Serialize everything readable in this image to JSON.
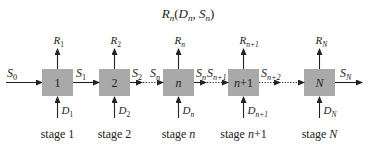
{
  "title": {
    "main": "R",
    "sub": "n",
    "args": [
      {
        "main": "D",
        "sub": "n"
      },
      {
        "main": "S",
        "sub": "n"
      }
    ]
  },
  "input_state": {
    "main": "S",
    "sub": "0"
  },
  "stages": [
    {
      "box_label": "1",
      "box_italic": false,
      "return": {
        "main": "R",
        "sub": "1"
      },
      "decision": {
        "main": "D",
        "sub": "1"
      },
      "out_state": {
        "main": "S",
        "sub": "1"
      },
      "caption": "stage",
      "caption_num": "1",
      "caption_italic": false
    },
    {
      "box_label": "2",
      "box_italic": false,
      "return": {
        "main": "R",
        "sub": "2"
      },
      "decision": {
        "main": "D",
        "sub": "2"
      },
      "out_state": {
        "main": "S",
        "sub": "2"
      },
      "caption": "stage",
      "caption_num": "2",
      "caption_italic": false
    },
    {
      "box_label": "n",
      "box_italic": true,
      "in_state": {
        "main": "S",
        "sub": "n"
      },
      "return": {
        "main": "R",
        "sub": "n"
      },
      "decision": {
        "main": "D",
        "sub": "n"
      },
      "out_state": {
        "main": "S",
        "sub": "n"
      },
      "caption": "stage",
      "caption_num": "n",
      "caption_italic": true
    },
    {
      "box_label": "n+1",
      "box_italic": true,
      "in_state": {
        "main": "S",
        "sub": "n+1"
      },
      "return": {
        "main": "R",
        "sub": "n+1"
      },
      "decision": {
        "main": "D",
        "sub": "n+1"
      },
      "out_state": {
        "main": "S",
        "sub": "n+2"
      },
      "caption": "stage",
      "caption_num": "n+1",
      "caption_italic": true
    },
    {
      "box_label": "N",
      "box_italic": true,
      "return": {
        "main": "R",
        "sub": "N"
      },
      "decision": {
        "main": "D",
        "sub": "N"
      },
      "out_state": {
        "main": "S",
        "sub": "N"
      },
      "caption": "stage",
      "caption_num": "N",
      "caption_italic": true
    }
  ],
  "colors": {
    "box_fill": "#a9a9a9",
    "ink": "#222222"
  }
}
